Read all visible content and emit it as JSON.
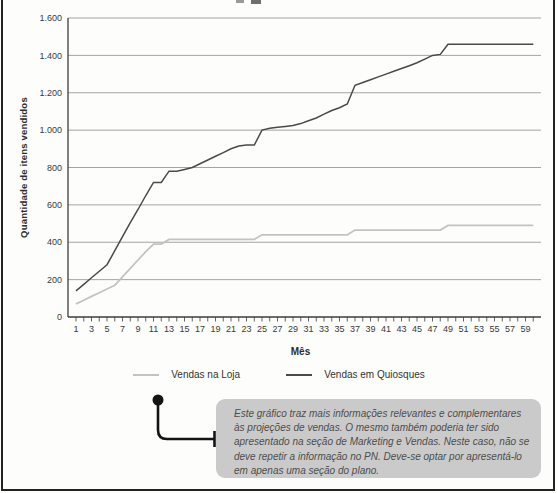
{
  "chart_data": {
    "type": "line",
    "title": "",
    "xlabel": "Mês",
    "ylabel": "Quantidade de itens vendidos",
    "xlim": [
      1,
      60
    ],
    "ylim": [
      0,
      1600
    ],
    "grid": "horizontal",
    "legend_position": "bottom",
    "y_ticks": [
      {
        "value": 0,
        "label": "0"
      },
      {
        "value": 200,
        "label": "200"
      },
      {
        "value": 400,
        "label": "400"
      },
      {
        "value": 600,
        "label": "600"
      },
      {
        "value": 800,
        "label": "800"
      },
      {
        "value": 1000,
        "label": "1.000"
      },
      {
        "value": 1200,
        "label": "1.200"
      },
      {
        "value": 1400,
        "label": "1.400"
      },
      {
        "value": 1600,
        "label": "1.600"
      }
    ],
    "x_tick_labels": [
      "1",
      "3",
      "5",
      "7",
      "9",
      "11",
      "13",
      "15",
      "17",
      "19",
      "21",
      "23",
      "25",
      "27",
      "29",
      "31",
      "33",
      "35",
      "37",
      "39",
      "41",
      "43",
      "45",
      "47",
      "49",
      "51",
      "53",
      "55",
      "57",
      "59"
    ],
    "series": [
      {
        "name": "Vendas na Loja",
        "color": "#c3c3c3",
        "values": [
          70,
          90,
          110,
          130,
          150,
          170,
          215,
          260,
          305,
          350,
          390,
          390,
          415,
          415,
          415,
          415,
          415,
          415,
          415,
          415,
          415,
          415,
          415,
          415,
          440,
          440,
          440,
          440,
          440,
          440,
          440,
          440,
          440,
          440,
          440,
          440,
          465,
          465,
          465,
          465,
          465,
          465,
          465,
          465,
          465,
          465,
          465,
          465,
          490,
          490,
          490,
          490,
          490,
          490,
          490,
          490,
          490,
          490,
          490,
          490
        ]
      },
      {
        "name": "Vendas em Quiosques",
        "color": "#4a4a4a",
        "values": [
          140,
          175,
          210,
          245,
          280,
          355,
          430,
          505,
          575,
          650,
          720,
          720,
          780,
          780,
          790,
          800,
          820,
          840,
          860,
          880,
          900,
          915,
          920,
          920,
          1000,
          1010,
          1015,
          1020,
          1025,
          1035,
          1050,
          1065,
          1085,
          1105,
          1120,
          1140,
          1240,
          1255,
          1270,
          1285,
          1300,
          1315,
          1330,
          1345,
          1360,
          1380,
          1400,
          1405,
          1460,
          1460,
          1460,
          1460,
          1460,
          1460,
          1460,
          1460,
          1460,
          1460,
          1460,
          1460
        ]
      }
    ],
    "colors": {
      "axis": "#3d3d3d",
      "grid": "#9a9a9a",
      "tick_text": "#3a3a3a"
    }
  },
  "callout": {
    "text": "Este gráfico traz mais informações relevantes e complementares às projeções de vendas. O mesmo também poderia ter sido apresentado na seção de Marketing e Vendas. Neste caso, não se deve repetir a informação no PN. Deve-se optar por apresentá-lo em apenas uma seção do plano."
  }
}
